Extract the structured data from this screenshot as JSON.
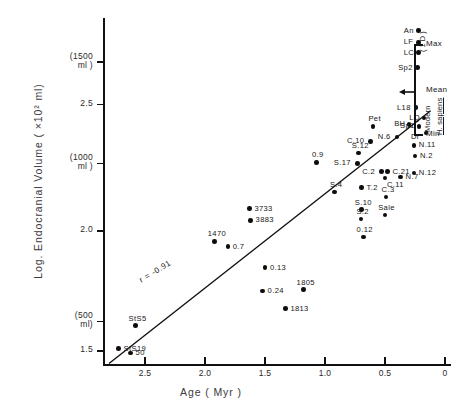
{
  "chart_data": {
    "type": "scatter",
    "title": "",
    "xlabel": "Age ( Myr )",
    "ylabel": "Log. Endocranial Volume ( ×10² ml)",
    "xlim": [
      2.85,
      -0.05
    ],
    "ylim": [
      1.42,
      3.06
    ],
    "x_reversed": true,
    "grid": false,
    "legend": null,
    "xticks": [
      {
        "value": 2.5,
        "label": "2.5"
      },
      {
        "value": 2.0,
        "label": "2.0"
      },
      {
        "value": 1.5,
        "label": "1.5"
      },
      {
        "value": 1.0,
        "label": "1.0"
      },
      {
        "value": 0.5,
        "label": "0.5"
      },
      {
        "value": 0.0,
        "label": "0"
      }
    ],
    "yticks": [
      {
        "value": 2.85,
        "label": "(1500\nml )"
      },
      {
        "value": 2.65,
        "label": "2.5"
      },
      {
        "value": 2.37,
        "label": "(1000\nml )"
      },
      {
        "value": 2.05,
        "label": "2.0"
      },
      {
        "value": 1.62,
        "label": "(500\nml)"
      },
      {
        "value": 1.48,
        "label": "1.5"
      }
    ],
    "regression": {
      "annotation": "r = -0.91",
      "x_start": 2.8,
      "y_start": 1.42,
      "x_end": 0.12,
      "y_end": 2.62
    },
    "points": [
      {
        "label": "An",
        "x": 0.22,
        "y": 3.0,
        "label_pos": "left"
      },
      {
        "label": "LF",
        "x": 0.22,
        "y": 2.945,
        "label_pos": "left"
      },
      {
        "label": "LC",
        "x": 0.22,
        "y": 2.895,
        "label_pos": "left"
      },
      {
        "label": "Sp2",
        "x": 0.23,
        "y": 2.825,
        "label_pos": "left"
      },
      {
        "label": "L18",
        "x": 0.24,
        "y": 2.635,
        "label_pos": "left"
      },
      {
        "label": "LQ",
        "x": 0.175,
        "y": 2.585,
        "label_pos": "left"
      },
      {
        "label": "BH",
        "x": 0.3,
        "y": 2.555,
        "label_pos": "left"
      },
      {
        "label": "Sp1",
        "x": 0.215,
        "y": 2.545,
        "label_pos": "left"
      },
      {
        "label": "Di",
        "x": 0.16,
        "y": 2.515,
        "label_pos": "left-below"
      },
      {
        "label": "Pet",
        "x": 0.6,
        "y": 2.545,
        "label_pos": "above"
      },
      {
        "label": "C.10",
        "x": 0.62,
        "y": 2.475,
        "label_pos": "left"
      },
      {
        "label": "N.6",
        "x": 0.4,
        "y": 2.495,
        "label_pos": "left"
      },
      {
        "label": "N.11",
        "x": 0.26,
        "y": 2.455,
        "label_pos": "right"
      },
      {
        "label": "N.2",
        "x": 0.25,
        "y": 2.405,
        "label_pos": "right"
      },
      {
        "label": "N.12",
        "x": 0.26,
        "y": 2.325,
        "label_pos": "right"
      },
      {
        "label": "S.12",
        "x": 0.72,
        "y": 2.42,
        "label_pos": "above"
      },
      {
        "label": "S.17",
        "x": 0.73,
        "y": 2.37,
        "label_pos": "left"
      },
      {
        "label": "C.2",
        "x": 0.53,
        "y": 2.33,
        "label_pos": "left"
      },
      {
        "label": "C.21",
        "x": 0.48,
        "y": 2.33,
        "label_pos": "right"
      },
      {
        "label": "C.11",
        "x": 0.5,
        "y": 2.3,
        "label_pos": "below-right"
      },
      {
        "label": "N.7",
        "x": 0.37,
        "y": 2.305,
        "label_pos": "right"
      },
      {
        "label": "0.9",
        "x": 1.07,
        "y": 2.375,
        "label_pos": "above"
      },
      {
        "label": "S.4",
        "x": 0.92,
        "y": 2.235,
        "label_pos": "above"
      },
      {
        "label": "T.2",
        "x": 0.695,
        "y": 2.255,
        "label_pos": "right"
      },
      {
        "label": "C.3",
        "x": 0.49,
        "y": 2.21,
        "label_pos": "above"
      },
      {
        "label": "S.10",
        "x": 0.695,
        "y": 2.15,
        "label_pos": "above"
      },
      {
        "label": "S.2",
        "x": 0.7,
        "y": 2.105,
        "label_pos": "above"
      },
      {
        "label": "Sale",
        "x": 0.5,
        "y": 2.125,
        "label_pos": "above"
      },
      {
        "label": "3733",
        "x": 1.63,
        "y": 2.155,
        "label_pos": "right"
      },
      {
        "label": "3883",
        "x": 1.62,
        "y": 2.1,
        "label_pos": "right"
      },
      {
        "label": "1470",
        "x": 1.92,
        "y": 2.0,
        "label_pos": "above"
      },
      {
        "label": "0.7",
        "x": 1.81,
        "y": 1.975,
        "label_pos": "right"
      },
      {
        "label": "0.13",
        "x": 1.5,
        "y": 1.875,
        "label_pos": "right"
      },
      {
        "label": "0.12",
        "x": 0.68,
        "y": 2.02,
        "label_pos": "above"
      },
      {
        "label": "0.24",
        "x": 1.52,
        "y": 1.765,
        "label_pos": "right"
      },
      {
        "label": "1805",
        "x": 1.18,
        "y": 1.77,
        "label_pos": "above"
      },
      {
        "label": "1813",
        "x": 1.33,
        "y": 1.68,
        "label_pos": "right"
      },
      {
        "label": "StS5",
        "x": 2.58,
        "y": 1.6,
        "label_pos": "above"
      },
      {
        "label": "StS19",
        "x": 2.72,
        "y": 1.49,
        "label_pos": "right"
      },
      {
        "label": "50",
        "x": 2.62,
        "y": 1.47,
        "label_pos": "right"
      }
    ],
    "annotations": [
      {
        "name": "max",
        "label": "Max"
      },
      {
        "name": "sd",
        "label": "( 1 D )"
      },
      {
        "name": "mean",
        "label": "Mean"
      },
      {
        "name": "min",
        "label": "Min"
      },
      {
        "name": "modern",
        "label": "Modern"
      },
      {
        "name": "hsapiens",
        "label": "H. sapiens"
      }
    ]
  }
}
